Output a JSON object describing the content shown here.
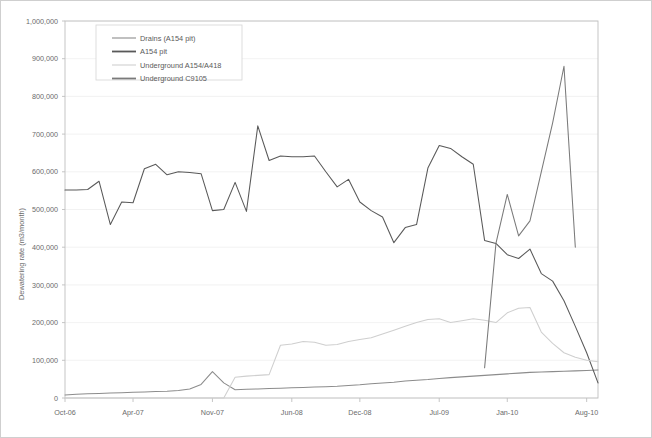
{
  "chart_data": {
    "type": "line",
    "title": "",
    "xlabel": "",
    "ylabel": "Dewatering rate (m3/month)",
    "ylim": [
      0,
      1000000
    ],
    "ytick_labels": [
      "0",
      "100,000",
      "200,000",
      "300,000",
      "400,000",
      "500,000",
      "600,000",
      "700,000",
      "800,000",
      "900,000",
      "1,000,000"
    ],
    "ytick_values": [
      0,
      100000,
      200000,
      300000,
      400000,
      500000,
      600000,
      700000,
      800000,
      900000,
      1000000
    ],
    "xtick_labels": [
      "Oct-06",
      "Apr-07",
      "Nov-07",
      "Jun-08",
      "Dec-08",
      "Jul-09",
      "Jan-10",
      "Aug-10"
    ],
    "xtick_months": [
      0,
      6,
      13,
      20,
      26,
      33,
      39,
      46
    ],
    "x_months_total": 47,
    "grid": true,
    "legend_position": "top-left",
    "colors": {
      "drains": "#8c8c8c",
      "a154_pit": "#595959",
      "underground_a154_a418": "#cfcfcf",
      "underground_c9105": "#7a7a7a",
      "gridline": "#efefef",
      "border": "#bfbfbf",
      "text": "#6b6b6b"
    },
    "series": [
      {
        "name": "Drains (A154 pit)",
        "color": "#8c8c8c",
        "x_start_month": 0,
        "values": [
          8000,
          10000,
          11000,
          12000,
          13000,
          14000,
          15000,
          16000,
          17000,
          18000,
          20000,
          24000,
          36000,
          70000,
          40000,
          22000,
          23000,
          24000,
          25000,
          26000,
          27000,
          28000,
          29000,
          30000,
          31000,
          33000,
          35000,
          38000,
          40000,
          42000,
          45000,
          47000,
          49000,
          52000,
          54000,
          56000,
          58000,
          60000,
          62000,
          64000,
          66000,
          68000,
          69000,
          70000,
          71000,
          72000,
          73000,
          74000
        ]
      },
      {
        "name": "A154 pit",
        "color": "#595959",
        "x_start_month": 0,
        "values": [
          552000,
          552000,
          553000,
          575000,
          460000,
          520000,
          518000,
          608000,
          620000,
          592000,
          600000,
          598000,
          595000,
          497000,
          500000,
          572000,
          495000,
          722000,
          630000,
          642000,
          640000,
          640000,
          642000,
          600000,
          560000,
          580000,
          520000,
          497000,
          480000,
          412000,
          452000,
          460000,
          610000,
          670000,
          662000,
          640000,
          620000,
          418000,
          410000,
          380000,
          370000,
          395000,
          330000,
          310000,
          258000,
          190000,
          120000,
          40000
        ]
      },
      {
        "name": "Underground A154/A418",
        "color": "#cfcfcf",
        "x_start_month": 0,
        "values": [
          0,
          0,
          0,
          0,
          0,
          0,
          0,
          0,
          0,
          0,
          0,
          0,
          0,
          0,
          0,
          55000,
          58000,
          60000,
          62000,
          140000,
          143000,
          150000,
          148000,
          140000,
          142000,
          150000,
          155000,
          160000,
          170000,
          180000,
          190000,
          200000,
          208000,
          210000,
          200000,
          205000,
          210000,
          206000,
          200000,
          226000,
          238000,
          240000,
          175000,
          145000,
          120000,
          108000,
          100000,
          96000
        ]
      },
      {
        "name": "Underground C9105",
        "color": "#7a7a7a",
        "x_start_month": 37,
        "values": [
          80000,
          410000,
          540000,
          430000,
          470000,
          600000,
          730000,
          880000,
          400000
        ]
      }
    ],
    "annotations": []
  },
  "legend": {
    "entries": [
      {
        "label": "Drains (A154 pit)"
      },
      {
        "label": "A154 pit"
      },
      {
        "label": "Underground A154/A418"
      },
      {
        "label": "Underground C9105"
      }
    ]
  }
}
